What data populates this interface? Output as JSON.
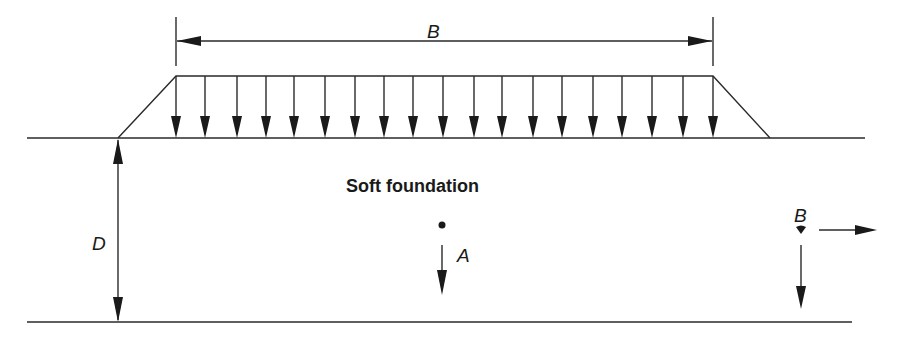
{
  "diagram": {
    "labels": {
      "width": "B",
      "depth": "D",
      "foundation": "Soft foundation",
      "point_a": "A",
      "point_b": "B"
    },
    "colors": {
      "line": "#2a2a2a",
      "background": "#ffffff"
    },
    "embankment": {
      "left_toe_x": 118,
      "left_crest_x": 176,
      "right_crest_x": 713,
      "right_toe_x": 770,
      "crest_y": 76,
      "ground_y": 138
    },
    "load_arrows_x": [
      176,
      205,
      237,
      266,
      294,
      325,
      355,
      384,
      413,
      443,
      474,
      502,
      533,
      562,
      593,
      622,
      652,
      683,
      713
    ],
    "load_arrow_count": 19,
    "ground_surface": {
      "x1": 27,
      "x2": 865,
      "y": 138
    },
    "foundation_base": {
      "x1": 27,
      "x2": 852,
      "y": 322
    },
    "width_dimension": {
      "x1": 176,
      "x2": 713,
      "y": 40
    },
    "depth_dimension": {
      "x": 118,
      "y1": 138,
      "y2": 322
    },
    "point_a": {
      "x": 442,
      "y": 225,
      "displacement": "down"
    },
    "point_b": {
      "x": 801,
      "y": 230,
      "displacement": [
        "down",
        "right"
      ]
    }
  }
}
